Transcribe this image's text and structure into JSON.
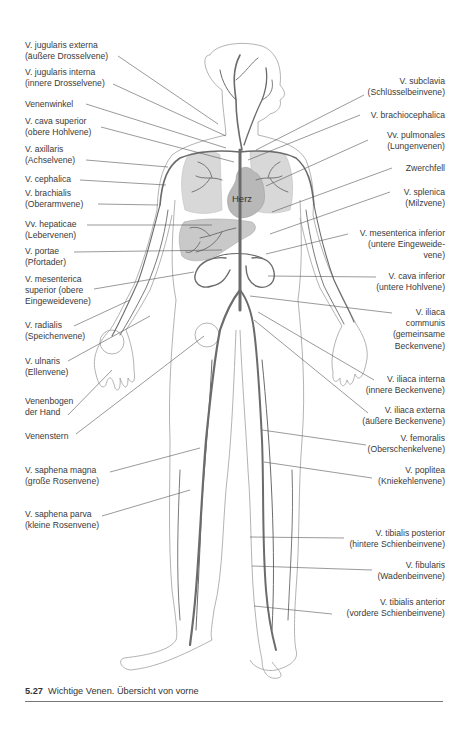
{
  "figure": {
    "number": "5.27",
    "caption": "Wichtige Venen. Übersicht von vorne",
    "heart_label": "Herz",
    "colors": {
      "vein": "#6b6b6b",
      "outline": "#9a9a9a",
      "organ_fill": "#d6d6d6",
      "heart_fill": "#b5b5b5",
      "leader_line": "#555555"
    }
  },
  "labels_left": [
    {
      "id": "jugularis-externa",
      "line1": "V. jugularis externa",
      "line2": "(äußere Drosselvene)"
    },
    {
      "id": "jugularis-interna",
      "line1": "V. jugularis interna",
      "line2": "(innere Drosselvene)"
    },
    {
      "id": "venenwinkel",
      "line1": "Venenwinkel"
    },
    {
      "id": "cava-superior",
      "line1": "V. cava superior",
      "line2": "(obere Hohlvene)"
    },
    {
      "id": "axillaris",
      "line1": "V. axillaris",
      "line2": "(Achselvene)"
    },
    {
      "id": "cephalica",
      "line1": "V. cephalica"
    },
    {
      "id": "brachialis",
      "line1": "V. brachialis",
      "line2": "(Oberarmvene)"
    },
    {
      "id": "hepaticae",
      "line1": "Vv. hepaticae",
      "line2": "(Lebervenen)"
    },
    {
      "id": "portae",
      "line1": "V. portae",
      "line2": "(Pfortader)"
    },
    {
      "id": "mesenterica-superior",
      "line1": "V. mesenterica",
      "line2": "superior (obere",
      "line3": "Eingeweidevene)"
    },
    {
      "id": "radialis",
      "line1": "V. radialis",
      "line2": "(Speichenvene)"
    },
    {
      "id": "ulnaris",
      "line1": "V. ulnaris",
      "line2": "(Ellenvene)"
    },
    {
      "id": "venenbogen",
      "line1": "Venenbogen",
      "line2": "der Hand"
    },
    {
      "id": "venenstern",
      "line1": "Venenstern"
    },
    {
      "id": "saphena-magna",
      "line1": "V. saphena magna",
      "line2": "(große Rosenvene)"
    },
    {
      "id": "saphena-parva",
      "line1": "V. saphena parva",
      "line2": "(kleine Rosenvene)"
    }
  ],
  "labels_right": [
    {
      "id": "subclavia",
      "line1": "V. subclavia",
      "line2": "(Schlüsselbeinvene)"
    },
    {
      "id": "brachiocephalica",
      "line1": "V. brachiocephalica"
    },
    {
      "id": "pulmonales",
      "line1": "Vv. pulmonales",
      "line2": "(Lungenvenen)"
    },
    {
      "id": "zwerchfell",
      "line1": "Zwerchfell"
    },
    {
      "id": "splenica",
      "line1": "V. splenica",
      "line2": "(Milzvene)"
    },
    {
      "id": "mesenterica-inferior",
      "line1": "V. mesenterica inferior",
      "line2": "(untere Eingeweide-",
      "line3": "vene)"
    },
    {
      "id": "cava-inferior",
      "line1": "V. cava inferior",
      "line2": "(untere Hohlvene)"
    },
    {
      "id": "iliaca-communis",
      "line1": "V. iliaca",
      "line2": "communis",
      "line3": "(gemeinsame",
      "line4": "Beckenvene)"
    },
    {
      "id": "iliaca-interna",
      "line1": "V. iliaca interna",
      "line2": "(innere Beckenvene)"
    },
    {
      "id": "iliaca-externa",
      "line1": "V. iliaca externa",
      "line2": "(äußere Beckenvene)"
    },
    {
      "id": "femoralis",
      "line1": "V. femoralis",
      "line2": "(Oberschenkelvene)"
    },
    {
      "id": "poplitea",
      "line1": "V. poplitea",
      "line2": "(Kniekehlenvene)"
    },
    {
      "id": "tibialis-posterior",
      "line1": "V. tibialis posterior",
      "line2": "(hintere Schienbeinvene)"
    },
    {
      "id": "fibularis",
      "line1": "V. fibularis",
      "line2": "(Wadenbeinvene)"
    },
    {
      "id": "tibialis-anterior",
      "line1": "V. tibialis anterior",
      "line2": "(vordere Schienbeinvene)"
    }
  ]
}
